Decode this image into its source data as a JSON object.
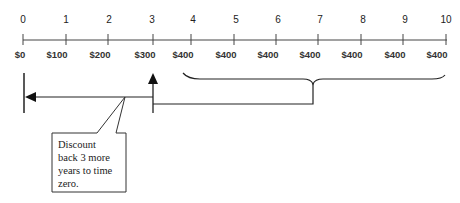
{
  "timeline": {
    "periods": [
      "0",
      "1",
      "2",
      "3",
      "4",
      "5",
      "6",
      "7",
      "8",
      "9",
      "10"
    ],
    "cash_flows": [
      "$0",
      "$100",
      "$200",
      "$300",
      "$400",
      "$400",
      "$400",
      "$400",
      "$400",
      "$400",
      "$400"
    ]
  },
  "callout": {
    "lines": [
      "Discount",
      "back 3 more",
      "years to time",
      "zero."
    ]
  },
  "colors": {
    "line": "#2a2a2a",
    "text": "#222222",
    "background": "#ffffff"
  }
}
